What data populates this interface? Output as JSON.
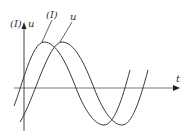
{
  "diagram": {
    "type": "phase-waveform",
    "axes": {
      "vertical_label_left": "(I)",
      "vertical_label_right": "u",
      "horizontal_label": "t"
    },
    "curves": [
      {
        "name": "current",
        "label": "(I)",
        "description": "sinusoid leading, peak left"
      },
      {
        "name": "voltage",
        "label": "u",
        "description": "sinusoid lagging, shifted right"
      }
    ],
    "colors": {
      "line": "#3a3a3a",
      "axis": "#555555",
      "background": "#ffffff"
    }
  }
}
